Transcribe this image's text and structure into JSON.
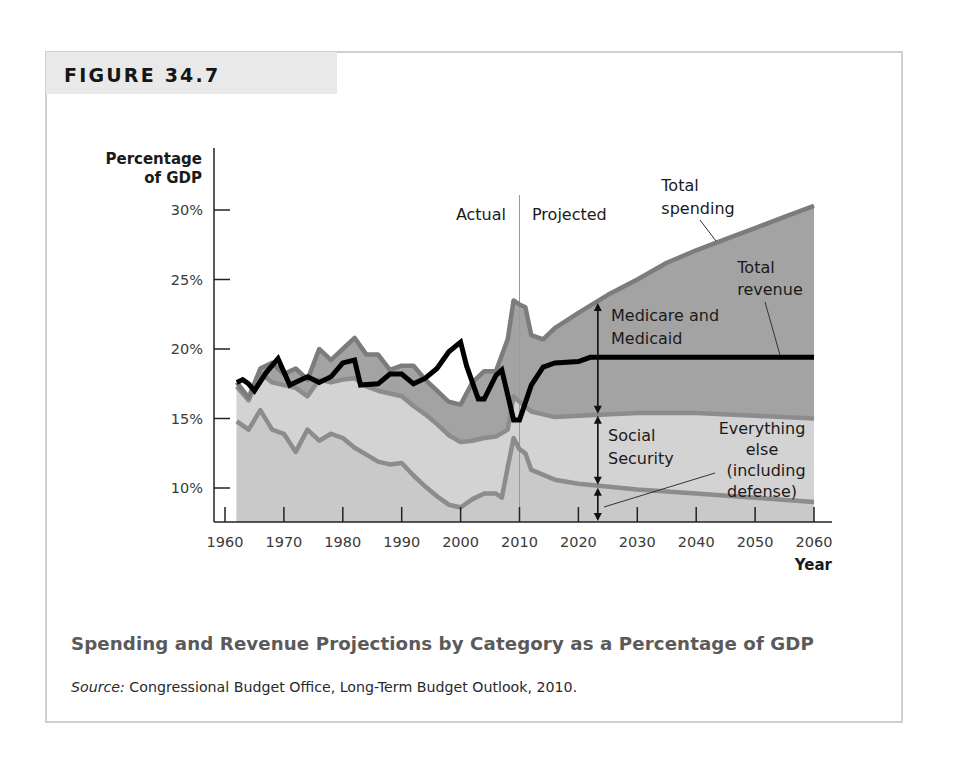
{
  "figure": {
    "number_label": "FIGURE 34.7",
    "caption": "Spending and Revenue Projections by Category as a Percentage of GDP",
    "source_prefix": "Source:",
    "source_text": " Congressional Budget Office, Long-Term Budget Outlook, 2010."
  },
  "chart_data": {
    "type": "area",
    "title": "Spending and Revenue Projections by Category as a Percentage of GDP",
    "xlabel": "Year",
    "ylabel": "Percentage of GDP",
    "ylabel_lines": [
      "Percentage",
      "of GDP"
    ],
    "x_ticks": [
      "1960",
      "1970",
      "1980",
      "1990",
      "2000",
      "2010",
      "2020",
      "2030",
      "2040",
      "2050",
      "2060"
    ],
    "y_ticks": [
      "10%",
      "15%",
      "20%",
      "25%",
      "30%"
    ],
    "ylim": [
      7.5,
      31
    ],
    "xlim": [
      1960,
      2060
    ],
    "grid": false,
    "divider": {
      "year": 2010,
      "left_label": "Actual",
      "right_label": "Projected"
    },
    "annotations": {
      "total_spending": [
        "Total",
        "spending"
      ],
      "total_revenue": [
        "Total",
        "revenue"
      ],
      "medicare": [
        "Medicare and",
        "Medicaid"
      ],
      "social_security": [
        "Social",
        "Security"
      ],
      "everything_else": [
        "Everything",
        "else",
        "(including",
        "defense)"
      ]
    },
    "series": [
      {
        "name": "Total spending",
        "kind": "stacked-area-top",
        "x": [
          1962,
          1964,
          1966,
          1968,
          1970,
          1972,
          1974,
          1976,
          1978,
          1980,
          1982,
          1984,
          1986,
          1988,
          1990,
          1992,
          1994,
          1996,
          1998,
          2000,
          2002,
          2004,
          2006,
          2008,
          2009,
          2010,
          2011,
          2012,
          2014,
          2016,
          2020,
          2025,
          2030,
          2035,
          2040,
          2045,
          2050,
          2055,
          2060
        ],
        "values": [
          17.6,
          16.5,
          18.6,
          19.0,
          18.2,
          18.6,
          17.8,
          20.0,
          19.2,
          20.0,
          20.8,
          19.6,
          19.6,
          18.5,
          18.8,
          18.8,
          17.8,
          17.0,
          16.2,
          16.0,
          17.6,
          18.4,
          18.4,
          20.7,
          23.5,
          23.2,
          23.0,
          21.0,
          20.7,
          21.5,
          22.6,
          23.9,
          25.0,
          26.2,
          27.1,
          27.9,
          28.7,
          29.5,
          30.3
        ]
      },
      {
        "name": "Social Security + Everything else (top of Social Security band)",
        "kind": "boundary",
        "x": [
          1962,
          1964,
          1966,
          1968,
          1970,
          1972,
          1974,
          1976,
          1978,
          1980,
          1982,
          1984,
          1986,
          1988,
          1990,
          1992,
          1994,
          1996,
          1998,
          2000,
          2002,
          2004,
          2006,
          2008,
          2009,
          2010,
          2012,
          2016,
          2020,
          2030,
          2040,
          2050,
          2060
        ],
        "values": [
          17.3,
          16.3,
          18.3,
          17.6,
          17.4,
          17.2,
          16.6,
          17.8,
          17.6,
          17.8,
          17.9,
          17.3,
          17.0,
          16.8,
          16.6,
          15.9,
          15.3,
          14.6,
          13.8,
          13.3,
          13.4,
          13.6,
          13.7,
          14.2,
          16.6,
          16.2,
          15.5,
          15.1,
          15.2,
          15.4,
          15.4,
          15.2,
          15.0
        ]
      },
      {
        "name": "Everything else (including defense)",
        "kind": "boundary",
        "x": [
          1962,
          1964,
          1966,
          1968,
          1970,
          1972,
          1974,
          1976,
          1978,
          1980,
          1982,
          1984,
          1986,
          1988,
          1990,
          1992,
          1994,
          1996,
          1998,
          2000,
          2002,
          2004,
          2006,
          2007,
          2008,
          2009,
          2010,
          2011,
          2012,
          2016,
          2020,
          2030,
          2040,
          2050,
          2060
        ],
        "values": [
          14.8,
          14.2,
          15.6,
          14.2,
          13.9,
          12.6,
          14.2,
          13.4,
          13.9,
          13.6,
          12.9,
          12.4,
          11.9,
          11.7,
          11.8,
          10.9,
          10.1,
          9.4,
          8.8,
          8.6,
          9.2,
          9.6,
          9.6,
          9.3,
          11.5,
          13.6,
          12.8,
          12.5,
          11.3,
          10.6,
          10.3,
          9.9,
          9.6,
          9.3,
          9.0
        ]
      },
      {
        "name": "Total revenue",
        "kind": "line",
        "x": [
          1962,
          1963,
          1964,
          1965,
          1967,
          1969,
          1971,
          1973,
          1974,
          1976,
          1978,
          1980,
          1982,
          1983,
          1986,
          1988,
          1990,
          1992,
          1994,
          1996,
          1998,
          2000,
          2001,
          2003,
          2004,
          2006,
          2007,
          2009,
          2010,
          2012,
          2014,
          2016,
          2020,
          2022,
          2060
        ],
        "values": [
          17.6,
          17.8,
          17.5,
          17.0,
          18.3,
          19.3,
          17.4,
          17.8,
          18.0,
          17.6,
          18.0,
          19.0,
          19.2,
          17.4,
          17.5,
          18.2,
          18.2,
          17.5,
          17.9,
          18.6,
          19.8,
          20.5,
          18.8,
          16.4,
          16.4,
          18.1,
          18.5,
          14.9,
          14.9,
          17.4,
          18.7,
          19.0,
          19.1,
          19.4,
          19.4
        ]
      }
    ],
    "colors": {
      "medicare_area": "#a3a3a3",
      "social_security_area": "#d3d3d3",
      "everything_else_area": "#c9c9c9",
      "boundary_line": "#8c8c8c",
      "spending_line": "#7c7c7c",
      "revenue_line": "#000000",
      "tab_bg": "#e9e9e9",
      "frame_border": "#cfcfcf",
      "caption_color": "#5a5a5a"
    }
  }
}
